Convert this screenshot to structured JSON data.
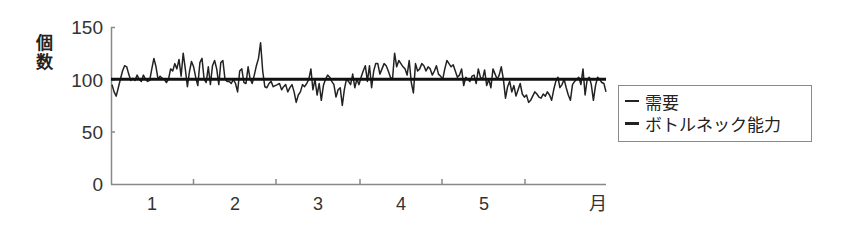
{
  "chart_data": {
    "type": "line",
    "title": "",
    "xlabel": "月",
    "ylabel": "個数",
    "ylim": [
      0,
      150
    ],
    "yticks": [
      0,
      50,
      100,
      150
    ],
    "xtick_labels": [
      "1",
      "2",
      "3",
      "4",
      "5"
    ],
    "x_unit_label": "月",
    "grid": false,
    "legend_position": "right",
    "series": [
      {
        "name": "需要",
        "style": "thin",
        "values": [
          95,
          88,
          84,
          92,
          100,
          108,
          113,
          112,
          105,
          99,
          101,
          99,
          104,
          100,
          98,
          104,
          100,
          98,
          99,
          110,
          120,
          112,
          100,
          103,
          101,
          100,
          97,
          100,
          110,
          108,
          115,
          110,
          119,
          103,
          125,
          110,
          93,
          107,
          117,
          112,
          102,
          94,
          116,
          120,
          100,
          97,
          112,
          95,
          113,
          118,
          110,
          95,
          116,
          118,
          100,
          98,
          98,
          96,
          100,
          96,
          88,
          108,
          110,
          97,
          96,
          112,
          100,
          96,
          104,
          113,
          120,
          135,
          108,
          93,
          92,
          96,
          98,
          93,
          94,
          95,
          96,
          90,
          93,
          95,
          88,
          92,
          95,
          88,
          78,
          85,
          88,
          95,
          93,
          96,
          100,
          110,
          90,
          100,
          85,
          96,
          80,
          94,
          100,
          104,
          102,
          98,
          95,
          83,
          90,
          92,
          75,
          90,
          100,
          98,
          95,
          105,
          92,
          100,
          95,
          102,
          108,
          113,
          98,
          113,
          92,
          108,
          115,
          115,
          105,
          110,
          115,
          113,
          108,
          102,
          100,
          125,
          112,
          118,
          115,
          112,
          110,
          104,
          118,
          97,
          87,
          115,
          108,
          110,
          115,
          113,
          108,
          112,
          110,
          104,
          108,
          113,
          105,
          103,
          100,
          110,
          118,
          115,
          112,
          114,
          108,
          102,
          104,
          110,
          94,
          102,
          100,
          98,
          103,
          104,
          96,
          110,
          102,
          100,
          109,
          94,
          100,
          92,
          110,
          105,
          100,
          104,
          112,
          100,
          82,
          93,
          98,
          88,
          94,
          84,
          90,
          96,
          86,
          83,
          85,
          78,
          80,
          84,
          88,
          86,
          83,
          82,
          86,
          84,
          88,
          85,
          80,
          90,
          98,
          102,
          92,
          95,
          100,
          92,
          85,
          80,
          95,
          98,
          100,
          102,
          95,
          110,
          85,
          100,
          102,
          95,
          80,
          94,
          102,
          100,
          97,
          96,
          88
        ]
      },
      {
        "name": "ボトルネック能力",
        "style": "thick",
        "values": [
          100
        ]
      }
    ]
  },
  "legend": {
    "items": [
      {
        "label": "需要"
      },
      {
        "label": "ボトルネック能力"
      }
    ]
  },
  "axis": {
    "y_label_chars": [
      "個",
      "数"
    ],
    "y_ticks": [
      "150",
      "100",
      "50",
      "0"
    ],
    "x_ticks": [
      "1",
      "2",
      "3",
      "4",
      "5"
    ],
    "x_end_label": "月"
  }
}
